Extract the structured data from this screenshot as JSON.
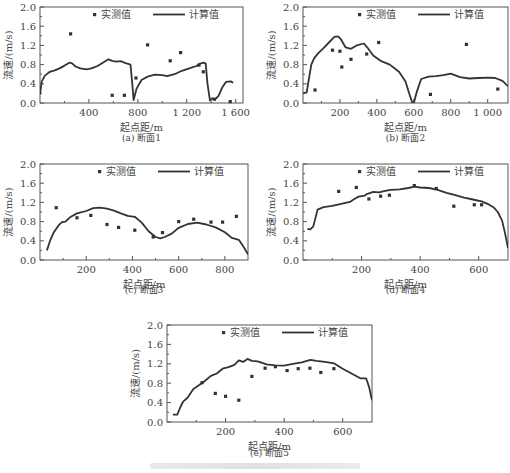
{
  "figure": {
    "legend": {
      "measured_label": "实测值",
      "computed_label": "计算值"
    },
    "ylabel": "流速/(m/s)",
    "xlabel": "起点距/m",
    "caption_note": "faded figure caption (illegible)"
  },
  "chart_data": [
    {
      "id": "a",
      "type": "line+scatter",
      "title": "(a) 断面1",
      "xlabel": "起点距/m",
      "ylabel": "流速/(m/s)",
      "xlim": [
        0,
        1660
      ],
      "ylim": [
        0,
        2.0
      ],
      "xticks": [
        400,
        800,
        1200,
        1600
      ],
      "xtick_labels": [
        "400",
        "800",
        "1 200",
        "1 600"
      ],
      "yticks": [
        0.0,
        0.4,
        0.8,
        1.2,
        1.6,
        2.0
      ],
      "ytick_labels": [
        "0.0",
        "0.4",
        "0.8",
        "1.2",
        "1.6",
        "2.0"
      ],
      "series": [
        {
          "name": "计算值",
          "kind": "line",
          "x": [
            0,
            15,
            40,
            80,
            120,
            160,
            200,
            240,
            260,
            290,
            330,
            380,
            420,
            470,
            520,
            560,
            590,
            620,
            660,
            700,
            740,
            755,
            765,
            790,
            830,
            880,
            940,
            1000,
            1040,
            1100,
            1160,
            1220,
            1280,
            1310,
            1340,
            1355,
            1370,
            1390,
            1410,
            1430,
            1460,
            1490,
            1520,
            1560,
            1580
          ],
          "y": [
            0.18,
            0.45,
            0.57,
            0.65,
            0.68,
            0.72,
            0.78,
            0.84,
            0.83,
            0.76,
            0.72,
            0.7,
            0.72,
            0.77,
            0.85,
            0.91,
            0.88,
            0.86,
            0.87,
            0.83,
            0.8,
            0.4,
            0.06,
            0.3,
            0.48,
            0.55,
            0.59,
            0.58,
            0.56,
            0.6,
            0.67,
            0.72,
            0.77,
            0.82,
            0.84,
            0.82,
            0.4,
            0.05,
            0.1,
            0.07,
            0.15,
            0.32,
            0.44,
            0.45,
            0.42
          ]
        },
        {
          "name": "实测值",
          "kind": "scatter",
          "x": [
            250,
            590,
            690,
            785,
            880,
            1065,
            1150,
            1300,
            1335,
            1425,
            1555
          ],
          "y": [
            1.44,
            0.16,
            0.16,
            0.52,
            1.21,
            0.88,
            1.05,
            0.79,
            0.65,
            0.08,
            0.03
          ]
        }
      ],
      "legend_position": "top-right",
      "grid": false
    },
    {
      "id": "b",
      "type": "line+scatter",
      "title": "(b) 断面2",
      "xlabel": "起点距/m",
      "ylabel": "流速/(m/s)",
      "xlim": [
        0,
        1110
      ],
      "ylim": [
        0,
        2.0
      ],
      "xticks": [
        200,
        400,
        600,
        800,
        1000
      ],
      "xtick_labels": [
        "200",
        "400",
        "600",
        "800",
        "1 000"
      ],
      "yticks": [
        0.0,
        0.4,
        0.8,
        1.2,
        1.6,
        2.0
      ],
      "ytick_labels": [
        "0.0",
        "0.4",
        "0.8",
        "1.2",
        "1.6",
        "2.0"
      ],
      "series": [
        {
          "name": "计算值",
          "kind": "line",
          "x": [
            0,
            20,
            30,
            45,
            60,
            80,
            110,
            140,
            170,
            190,
            205,
            230,
            260,
            290,
            330,
            350,
            380,
            420,
            470,
            520,
            555,
            575,
            590,
            600,
            615,
            640,
            680,
            720,
            760,
            800,
            850,
            900,
            950,
            1000,
            1040,
            1080,
            1110
          ],
          "y": [
            0.2,
            0.22,
            0.45,
            0.8,
            0.93,
            1.03,
            1.14,
            1.26,
            1.38,
            1.39,
            1.33,
            1.16,
            1.13,
            1.2,
            1.24,
            1.15,
            0.99,
            0.88,
            0.8,
            0.65,
            0.45,
            0.2,
            0.02,
            0.0,
            0.22,
            0.5,
            0.55,
            0.56,
            0.58,
            0.61,
            0.54,
            0.51,
            0.52,
            0.53,
            0.52,
            0.46,
            0.35
          ]
        },
        {
          "name": "实测值",
          "kind": "scatter",
          "x": [
            65,
            160,
            200,
            210,
            260,
            345,
            410,
            690,
            885,
            1055
          ],
          "y": [
            0.27,
            1.1,
            1.08,
            0.75,
            0.91,
            1.02,
            1.26,
            0.18,
            1.22,
            0.29
          ]
        }
      ],
      "legend_position": "top-right",
      "grid": false
    },
    {
      "id": "c",
      "type": "line+scatter",
      "title": "(c) 断面3",
      "xlabel": "起点距/m",
      "ylabel": "流速/(m/s)",
      "xlim": [
        0,
        900
      ],
      "ylim": [
        0,
        2.0
      ],
      "xticks": [
        200,
        400,
        600,
        800
      ],
      "xtick_labels": [
        "200",
        "400",
        "600",
        "800"
      ],
      "yticks": [
        0.0,
        0.4,
        0.8,
        1.2,
        1.6,
        2.0
      ],
      "ytick_labels": [
        "0.0",
        "0.4",
        "0.8",
        "1.2",
        "1.6",
        "2.0"
      ],
      "series": [
        {
          "name": "计算值",
          "kind": "line",
          "x": [
            30,
            45,
            60,
            80,
            95,
            110,
            130,
            160,
            200,
            230,
            260,
            290,
            320,
            350,
            380,
            410,
            440,
            470,
            500,
            520,
            540,
            570,
            600,
            640,
            680,
            720,
            760,
            800,
            830,
            860,
            880,
            900
          ],
          "y": [
            0.2,
            0.42,
            0.58,
            0.72,
            0.79,
            0.8,
            0.89,
            0.97,
            1.02,
            1.08,
            1.09,
            1.07,
            1.03,
            0.97,
            0.92,
            0.9,
            0.78,
            0.6,
            0.48,
            0.45,
            0.48,
            0.55,
            0.67,
            0.75,
            0.78,
            0.74,
            0.68,
            0.58,
            0.46,
            0.42,
            0.28,
            0.12
          ]
        },
        {
          "name": "实测值",
          "kind": "scatter",
          "x": [
            70,
            160,
            220,
            290,
            340,
            410,
            490,
            530,
            600,
            665,
            740,
            790,
            850
          ],
          "y": [
            1.09,
            0.88,
            0.93,
            0.74,
            0.68,
            0.62,
            0.48,
            0.57,
            0.8,
            0.85,
            0.79,
            0.79,
            0.91
          ]
        }
      ],
      "legend_position": "top-right",
      "grid": false
    },
    {
      "id": "d",
      "type": "line+scatter",
      "title": "(d) 断面4",
      "xlabel": "起点距/m",
      "ylabel": "流速/(m/s)",
      "xlim": [
        0,
        700
      ],
      "ylim": [
        0,
        2.0
      ],
      "xticks": [
        200,
        400,
        600
      ],
      "xtick_labels": [
        "200",
        "400",
        "600"
      ],
      "yticks": [
        0.0,
        0.4,
        0.8,
        1.2,
        1.6,
        2.0
      ],
      "ytick_labels": [
        "0.0",
        "0.4",
        "0.8",
        "1.2",
        "1.6",
        "2.0"
      ],
      "series": [
        {
          "name": "计算值",
          "kind": "line",
          "x": [
            15,
            25,
            35,
            50,
            70,
            100,
            130,
            160,
            175,
            190,
            210,
            220,
            240,
            260,
            280,
            300,
            330,
            360,
            380,
            400,
            430,
            460,
            490,
            520,
            550,
            580,
            610,
            630,
            650,
            665,
            680,
            690,
            700
          ],
          "y": [
            0.65,
            0.64,
            0.7,
            1.05,
            1.1,
            1.13,
            1.17,
            1.21,
            1.27,
            1.32,
            1.34,
            1.38,
            1.42,
            1.41,
            1.44,
            1.46,
            1.47,
            1.5,
            1.53,
            1.51,
            1.5,
            1.46,
            1.4,
            1.35,
            1.3,
            1.26,
            1.22,
            1.17,
            1.1,
            1.0,
            0.82,
            0.55,
            0.25
          ]
        },
        {
          "name": "实测值",
          "kind": "scatter",
          "x": [
            122,
            182,
            225,
            265,
            295,
            380,
            455,
            515,
            585,
            610
          ],
          "y": [
            1.43,
            1.51,
            1.27,
            1.33,
            1.35,
            1.55,
            1.49,
            1.12,
            1.15,
            1.15
          ]
        }
      ],
      "legend_position": "top-right",
      "grid": false
    },
    {
      "id": "e",
      "type": "line+scatter",
      "title": "(e) 断面5",
      "xlabel": "起点距/m",
      "ylabel": "流速/(m/s)",
      "xlim": [
        0,
        700
      ],
      "ylim": [
        0,
        2.0
      ],
      "xticks": [
        200,
        400,
        600
      ],
      "xtick_labels": [
        "200",
        "400",
        "600"
      ],
      "yticks": [
        0.0,
        0.4,
        0.8,
        1.2,
        1.6,
        2.0
      ],
      "ytick_labels": [
        "0.0",
        "0.4",
        "0.8",
        "1.2",
        "1.6",
        "2.0"
      ],
      "series": [
        {
          "name": "计算值",
          "kind": "line",
          "x": [
            20,
            35,
            45,
            55,
            70,
            90,
            110,
            130,
            150,
            170,
            190,
            210,
            230,
            245,
            260,
            275,
            290,
            310,
            340,
            370,
            400,
            430,
            460,
            490,
            510,
            540,
            570,
            600,
            630,
            660,
            680,
            690,
            700
          ],
          "y": [
            0.15,
            0.15,
            0.3,
            0.42,
            0.5,
            0.68,
            0.76,
            0.85,
            0.95,
            1.0,
            1.1,
            1.13,
            1.18,
            1.27,
            1.24,
            1.3,
            1.26,
            1.25,
            1.19,
            1.17,
            1.16,
            1.2,
            1.23,
            1.28,
            1.26,
            1.24,
            1.21,
            1.1,
            1.0,
            0.9,
            0.9,
            0.72,
            0.45
          ]
        },
        {
          "name": "实测值",
          "kind": "scatter",
          "x": [
            120,
            165,
            200,
            245,
            290,
            335,
            370,
            410,
            448,
            488,
            525,
            570
          ],
          "y": [
            0.81,
            0.59,
            0.53,
            0.45,
            0.94,
            1.11,
            1.14,
            1.06,
            1.1,
            1.11,
            1.02,
            1.1
          ]
        }
      ],
      "legend_position": "top-right",
      "grid": false
    }
  ]
}
